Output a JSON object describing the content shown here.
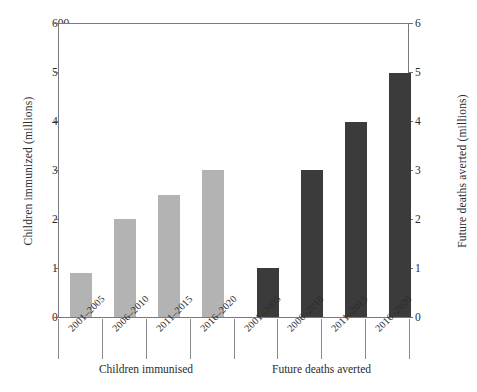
{
  "chart_data": {
    "type": "bar",
    "title": "",
    "subtitle": "",
    "grid": false,
    "legend_position": "none",
    "categories": [
      "2001–2005",
      "2006–2010",
      "2011–2015",
      "2016–2020",
      "2001–2005",
      "2006–2010",
      "2011–2015",
      "2016–2020"
    ],
    "groups": [
      {
        "label": "Children immunised",
        "axis": "left",
        "color": "#b3b3b3",
        "categories": [
          "2001–2005",
          "2006–2010",
          "2011–2015",
          "2016–2020"
        ],
        "values": [
          90,
          200,
          250,
          300
        ]
      },
      {
        "label": "Future deaths averted",
        "axis": "right",
        "color": "#3b3b3b",
        "categories": [
          "2001–2005",
          "2006–2010",
          "2011–2015",
          "2016–2020"
        ],
        "values": [
          1.0,
          3.0,
          4.0,
          5.0
        ]
      }
    ],
    "series": [
      {
        "name": "Children immunised",
        "axis": "left",
        "values": [
          90,
          200,
          250,
          300,
          null,
          null,
          null,
          null
        ]
      },
      {
        "name": "Future deaths averted",
        "axis": "right",
        "values": [
          null,
          null,
          null,
          null,
          1.0,
          3.0,
          4.0,
          5.0
        ]
      }
    ],
    "xlabel": "",
    "ylabel": "Children immunized (millions)",
    "ylabel_right": "Future deaths averted  (millions)",
    "ylim": [
      0,
      600
    ],
    "yticks": [
      0,
      100,
      200,
      300,
      400,
      500,
      600
    ],
    "ylim_right": [
      0,
      6
    ],
    "yticks_right": [
      0,
      1,
      2,
      3,
      4,
      5,
      6
    ]
  },
  "axes": {
    "left": {
      "title": "Children immunized (millions)",
      "ticks": [
        "0",
        "100",
        "200",
        "300",
        "400",
        "500",
        "600"
      ]
    },
    "right": {
      "title": "Future deaths averted  (millions)",
      "ticks": [
        "0",
        "1",
        "2",
        "3",
        "4",
        "5",
        "6"
      ]
    }
  },
  "categories": {
    "labels": [
      "2001–2005",
      "2006–2010",
      "2011–2015",
      "2016–2020",
      "2001–2005",
      "2006–2010",
      "2011–2015",
      "2016–2020"
    ]
  },
  "group_labels": {
    "left": "Children immunised",
    "right": "Future deaths averted"
  },
  "colors": {
    "bar_light": "#b3b3b3",
    "bar_dark": "#3b3b3b",
    "frame": "#7a7a7a",
    "text": "#2b2b2b"
  }
}
